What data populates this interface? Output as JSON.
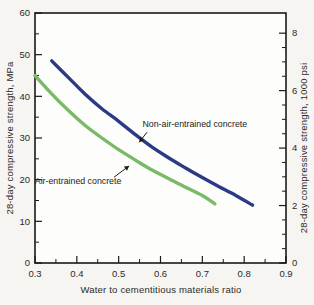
{
  "figure": {
    "background": "#f6f5f1",
    "plot_background": "#fdfdfb",
    "axis_color": "#1a1a1a",
    "text_color": "#2b2b2b"
  },
  "chart_data": {
    "type": "line",
    "title": "",
    "xlabel": "Water to cementitious materials ratio",
    "ylabel_left": "28-day compressive strength, MPa",
    "ylabel_right": "28-day compressive strength, 1000 psi",
    "grid": false,
    "x_axis": {
      "min": 0.3,
      "max": 0.9,
      "major_ticks": [
        0.3,
        0.4,
        0.5,
        0.6,
        0.7,
        0.8,
        0.9
      ],
      "major_labels": [
        "0.3",
        "0.4",
        "0.5",
        "0.6",
        "0.7",
        "0.8",
        "0.9"
      ],
      "minor_ticks": [
        0.35,
        0.45,
        0.55,
        0.65,
        0.75,
        0.85
      ]
    },
    "y_axis_left": {
      "min": 0,
      "max": 60,
      "unit": "MPa",
      "major_ticks": [
        0,
        10,
        20,
        30,
        40,
        50,
        60
      ],
      "major_labels": [
        "0",
        "10",
        "20",
        "30",
        "40",
        "50",
        "60"
      ],
      "minor_ticks": [
        5,
        15,
        25,
        35,
        45,
        55
      ]
    },
    "y_axis_right": {
      "min": 0,
      "unit": "1000 psi",
      "mpa_per_unit": 6.89476,
      "major_ticks": [
        0,
        2,
        4,
        6,
        8
      ],
      "major_labels": [
        "0",
        "2",
        "4",
        "6",
        "8"
      ],
      "minor_ticks": [
        0.5,
        1,
        1.5,
        2.5,
        3,
        3.5,
        4.5,
        5,
        5.5,
        6.5,
        7,
        7.5
      ]
    },
    "series": [
      {
        "name": "Air-entrained concrete",
        "color": "#79b968",
        "line_width": 3.4,
        "points": [
          [
            0.3,
            45
          ],
          [
            0.34,
            40.6
          ],
          [
            0.38,
            36.6
          ],
          [
            0.42,
            33
          ],
          [
            0.46,
            30
          ],
          [
            0.5,
            27.2
          ],
          [
            0.54,
            24.7
          ],
          [
            0.58,
            22.3
          ],
          [
            0.62,
            20.2
          ],
          [
            0.66,
            18.2
          ],
          [
            0.7,
            16.2
          ],
          [
            0.73,
            14.2
          ]
        ]
      },
      {
        "name": "Non-air-entrained concrete",
        "color": "#2a3a87",
        "line_width": 3.4,
        "points": [
          [
            0.34,
            48.5
          ],
          [
            0.38,
            44.5
          ],
          [
            0.42,
            40.5
          ],
          [
            0.46,
            37
          ],
          [
            0.5,
            34
          ],
          [
            0.54,
            30.8
          ],
          [
            0.58,
            27.8
          ],
          [
            0.62,
            25.2
          ],
          [
            0.66,
            22.8
          ],
          [
            0.7,
            20.5
          ],
          [
            0.74,
            18.3
          ],
          [
            0.78,
            16.2
          ],
          [
            0.82,
            13.9
          ]
        ]
      }
    ],
    "annotations": [
      {
        "text": "Non-air-entrained concrete",
        "label_at": [
          0.682,
          33.3
        ],
        "arrow_from": [
          0.568,
          31.4
        ],
        "arrow_to": [
          0.549,
          29.0
        ]
      },
      {
        "text": "Air-entrained concrete",
        "label_at": [
          0.403,
          19.7
        ],
        "arrow_from": [
          0.489,
          20.6
        ],
        "arrow_to": [
          0.525,
          23.3
        ]
      }
    ]
  }
}
